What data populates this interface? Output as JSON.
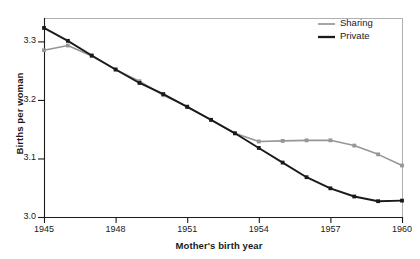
{
  "chart_data": {
    "type": "line",
    "title": "",
    "xlabel": "Mother's birth year",
    "ylabel": "Births per woman",
    "xlim": [
      1945,
      1960
    ],
    "ylim": [
      3.0,
      3.34
    ],
    "grid": false,
    "legend_position": "top-right",
    "xticks": [
      "1945",
      "1948",
      "1951",
      "1954",
      "1957",
      "1960"
    ],
    "xtick_values": [
      1945,
      1948,
      1951,
      1954,
      1957,
      1960
    ],
    "yticks": [
      "3.0",
      "3.1",
      "3.2",
      "3.3"
    ],
    "ytick_values": [
      3.0,
      3.1,
      3.2,
      3.3
    ],
    "x": [
      1945,
      1946,
      1947,
      1948,
      1949,
      1950,
      1951,
      1952,
      1953,
      1954,
      1955,
      1956,
      1957,
      1958,
      1959,
      1960
    ],
    "series": [
      {
        "name": "Sharing",
        "color": "#969696",
        "values": [
          3.285,
          3.293,
          3.275,
          3.252,
          3.232,
          3.208,
          3.189,
          3.166,
          3.143,
          3.129,
          3.13,
          3.131,
          3.131,
          3.122,
          3.107,
          3.088
        ]
      },
      {
        "name": "Private",
        "color": "#1a1a1a",
        "values": [
          3.323,
          3.301,
          3.276,
          3.252,
          3.229,
          3.21,
          3.188,
          3.166,
          3.143,
          3.118,
          3.093,
          3.068,
          3.049,
          3.035,
          3.027,
          3.028
        ]
      }
    ]
  },
  "legend": {
    "items": [
      {
        "label": "Sharing",
        "color": "#969696"
      },
      {
        "label": "Private",
        "color": "#1a1a1a"
      }
    ]
  },
  "axes": {
    "frame_color": "#b0b0b0",
    "axis_color": "#1a1a1a"
  }
}
